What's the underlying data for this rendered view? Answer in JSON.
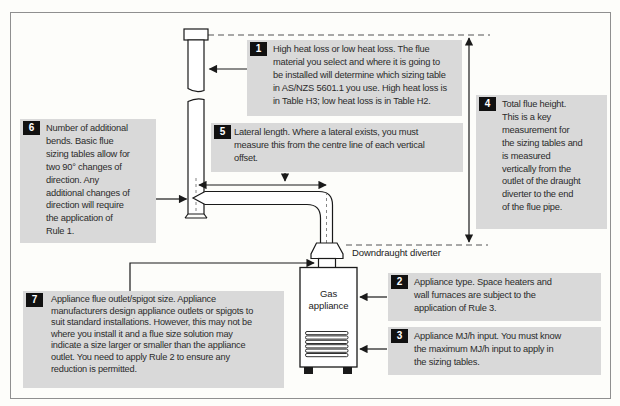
{
  "figure": {
    "callouts": [
      {
        "number": "1",
        "text": "High heat loss or low heat loss. The flue\nmaterial you select and where it is going to\nbe installed will determine which sizing table\nin AS/NZS 5601.1 you use. High heat loss is\nin Table H3; low heat loss is in Table H2."
      },
      {
        "number": "2",
        "text": "Appliance type. Space heaters and\nwall furnaces are subject to the\napplication of Rule 3."
      },
      {
        "number": "3",
        "text": "Appliance MJ/h input. You must know\nthe maximum MJ/h input to apply in\nthe sizing tables."
      },
      {
        "number": "4",
        "text": "Total flue height.\nThis is a key\nmeasurement for\nthe sizing tables and\nis measured\nvertically from the\noutlet of the draught\ndiverter to the end\nof the flue pipe."
      },
      {
        "number": "5",
        "text": "Lateral length. Where a lateral exists, you must\nmeasure this from the centre line of each vertical\noffset."
      },
      {
        "number": "6",
        "text": "Number of additional\nbends. Basic flue\nsizing tables allow for\ntwo 90° changes of\ndirection. Any\nadditional changes of\ndirection will require\nthe application of\nRule 1."
      },
      {
        "number": "7",
        "text": "Appliance flue outlet/spigot size. Appliance\nmanufacturers design appliance outlets or spigots to\nsuit standard installations. However, this may not be\nwhere you install it and a flue size solution may\nindicate a size larger or smaller than the appliance\noutlet. You need to apply Rule 2 to ensure any\nreduction is permitted."
      }
    ],
    "labels": {
      "downdraught_diverter": "Downdraught diverter",
      "gas_appliance": "Gas appliance"
    },
    "colors": {
      "callout_bg": "#d9d9d9",
      "badge_bg": "#111111",
      "badge_text": "#ffffff",
      "line": "#1a1a1a",
      "border": "#8f8f8f"
    }
  }
}
